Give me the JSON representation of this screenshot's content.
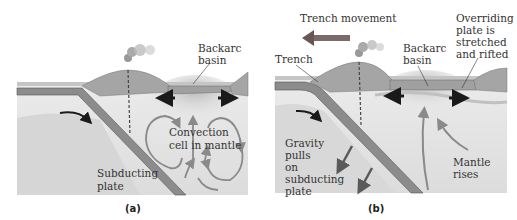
{
  "figure": {
    "panels": [
      {
        "id": "a",
        "caption": "(a)",
        "labels": {
          "backarc_line1": "Backarc",
          "backarc_line2": "basin",
          "convection_line1": "Convection",
          "convection_line2": "cell in mantle",
          "subducting_line1": "Subducting",
          "subducting_line2": "plate"
        }
      },
      {
        "id": "b",
        "caption": "(b)",
        "labels": {
          "trench_movement": "Trench movement",
          "trench": "Trench",
          "backarc_line1": "Backarc",
          "backarc_line2": "basin",
          "overriding_line1": "Overriding",
          "overriding_line2": "plate is",
          "overriding_line3": "stretched",
          "overriding_line4": "and rifted",
          "gravity_line1": "Gravity",
          "gravity_line2": "pulls",
          "gravity_line3": "on",
          "gravity_line4": "subducting",
          "gravity_line5": "plate",
          "mantle_line1": "Mantle",
          "mantle_line2": "rises"
        }
      }
    ],
    "colors": {
      "crust": "#a9a9a9",
      "plate": "#8c8c8c",
      "plate_edge": "#555555",
      "mantle": "#e6e6e6",
      "deep_mantle": "#d4d4d4",
      "arrow_dark": "#1a1a1a",
      "arrow_gray": "#8a8a8a",
      "trench_arrow": "#7a6a6a"
    }
  }
}
